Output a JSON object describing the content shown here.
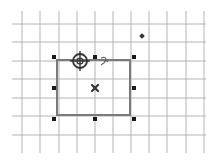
{
  "canvas": {
    "width": 216,
    "height": 167,
    "background": "#ffffff"
  },
  "grid": {
    "color": "#b4b4b4",
    "vertical_x": [
      22,
      40,
      59,
      77,
      95,
      113,
      131,
      149,
      167,
      186,
      204
    ],
    "vertical_y_range": [
      11,
      153
    ],
    "horizontal_y": [
      24,
      42,
      61,
      79,
      98,
      116,
      135
    ],
    "horizontal_x_range": [
      12,
      206
    ]
  },
  "selected_shape": {
    "type": "rectangle",
    "x": 57,
    "y": 60,
    "width": 73,
    "height": 55,
    "stroke": "#7a7a7a",
    "stroke_width": 2
  },
  "selection_handles": [
    {
      "id": "top-left",
      "x": 54,
      "y": 57
    },
    {
      "id": "top-center",
      "x": 95,
      "y": 57
    },
    {
      "id": "top-right",
      "x": 134,
      "y": 57
    },
    {
      "id": "middle-left",
      "x": 54,
      "y": 88
    },
    {
      "id": "middle-right",
      "x": 134,
      "y": 88
    },
    {
      "id": "bottom-left",
      "x": 54,
      "y": 119
    },
    {
      "id": "bottom-center",
      "x": 95,
      "y": 119
    },
    {
      "id": "bottom-right",
      "x": 134,
      "y": 119
    }
  ],
  "center_marker": {
    "x": 95,
    "y": 88,
    "icon": "x-mark-icon"
  },
  "rotation_pivot": {
    "x": 80,
    "y": 61,
    "icon": "crosshair-target-icon"
  },
  "rotate_cursor": {
    "x": 101,
    "y": 58,
    "icon": "rotate-arrow-icon"
  },
  "extra_point": {
    "x": 142,
    "y": 36,
    "icon": "diamond-point-icon"
  },
  "colors": {
    "handle": "#1a1a1a",
    "marker": "#333333"
  }
}
